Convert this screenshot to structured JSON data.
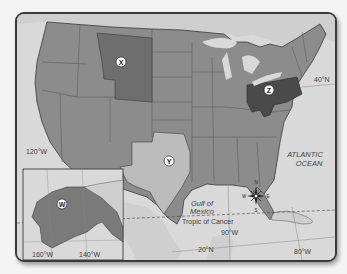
{
  "map": {
    "type": "reference-map",
    "subject": "United States regions",
    "colors": {
      "water": "#d9d9d9",
      "land_default": "#8c8c8c",
      "region_x": "#6e6e6e",
      "region_y": "#bcbcbc",
      "region_z": "#4a4a4a",
      "region_w": "#7a7a7a",
      "foreign_land": "#cfcfcf",
      "border": "#3a3a3a"
    },
    "markers": [
      {
        "id": "x",
        "label": "X",
        "region": "Montana / Wyoming area"
      },
      {
        "id": "y",
        "label": "Y",
        "region": "Texas"
      },
      {
        "id": "z",
        "label": "Z",
        "region": "Ohio / Pennsylvania / West Virginia"
      },
      {
        "id": "w",
        "label": "W",
        "region": "Alaska"
      }
    ],
    "water_labels": {
      "atlantic_line1": "ATLANTIC",
      "atlantic_line2": "OCEAN",
      "gulf_line1": "Gulf of",
      "gulf_line2": "Mexico"
    },
    "lines": {
      "tropic": "Tropic of Cancer"
    },
    "coordinates": {
      "lat_40": "40°N",
      "lat_20": "20°N",
      "lon_120": "120°W",
      "lon_90": "90°W",
      "lon_80": "80°W",
      "inset_lon_160": "160°W",
      "inset_lon_140": "140°W"
    },
    "compass": {
      "n": "N",
      "s": "S",
      "e": "E",
      "w": "W"
    }
  }
}
